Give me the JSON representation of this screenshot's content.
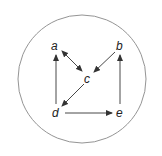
{
  "diagram": {
    "boundary": {
      "shape": "circle",
      "cx": 82,
      "cy": 79,
      "r": 64,
      "stroke": "#888888"
    },
    "nodes": [
      {
        "id": "a",
        "label": "a",
        "x": 55,
        "y": 46
      },
      {
        "id": "b",
        "label": "b",
        "x": 120,
        "y": 46
      },
      {
        "id": "c",
        "label": "c",
        "x": 88,
        "y": 79
      },
      {
        "id": "d",
        "label": "d",
        "x": 56,
        "y": 113
      },
      {
        "id": "e",
        "label": "e",
        "x": 120,
        "y": 113
      }
    ],
    "edges": [
      {
        "from": "a",
        "to": "c",
        "bidirectional": true
      },
      {
        "from": "b",
        "to": "c",
        "bidirectional": false
      },
      {
        "from": "c",
        "to": "d",
        "bidirectional": false
      },
      {
        "from": "d",
        "to": "a",
        "bidirectional": false
      },
      {
        "from": "d",
        "to": "e",
        "bidirectional": false
      },
      {
        "from": "e",
        "to": "b",
        "bidirectional": false
      }
    ],
    "colors": {
      "edge": "#333333",
      "label": "#222222"
    }
  }
}
